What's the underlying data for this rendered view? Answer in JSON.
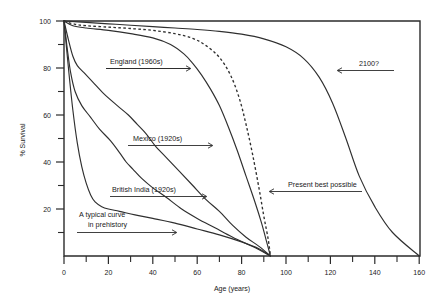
{
  "chart_data": {
    "type": "line",
    "title": "",
    "xlabel": "Age (years)",
    "ylabel": "% Survival",
    "xlim": [
      0,
      160
    ],
    "ylim": [
      0,
      100
    ],
    "grid": false,
    "legend_position": "inline-annotations",
    "x_ticks_major": [
      0,
      20,
      40,
      60,
      80,
      100,
      120,
      140,
      160
    ],
    "x_ticks_minor": [
      10,
      30,
      50,
      70,
      90,
      110,
      130,
      150
    ],
    "y_ticks_major": [
      20,
      40,
      60,
      80,
      100
    ],
    "y_ticks_minor": [
      10,
      30,
      50,
      70,
      90
    ],
    "x_tick_labels": [
      "0",
      "20",
      "40",
      "60",
      "80",
      "100",
      "120",
      "140",
      "160"
    ],
    "y_tick_labels": [
      "20",
      "40",
      "60",
      "80",
      "100"
    ],
    "series": [
      {
        "name": "2100?",
        "style": "solid",
        "annotation": "2100?",
        "points": [
          [
            0,
            100
          ],
          [
            10,
            99.4
          ],
          [
            20,
            98.8
          ],
          [
            30,
            98.2
          ],
          [
            40,
            97.6
          ],
          [
            50,
            97
          ],
          [
            60,
            96.4
          ],
          [
            70,
            95.6
          ],
          [
            80,
            94.4
          ],
          [
            90,
            92.4
          ],
          [
            100,
            89
          ],
          [
            108,
            84
          ],
          [
            115,
            76
          ],
          [
            121,
            65
          ],
          [
            127,
            50
          ],
          [
            133,
            34
          ],
          [
            140,
            21
          ],
          [
            148,
            10
          ],
          [
            160,
            0
          ]
        ]
      },
      {
        "name": "Present best possible",
        "style": "dashed",
        "annotation": "Present best possible",
        "points": [
          [
            0,
            100
          ],
          [
            5,
            98.6
          ],
          [
            10,
            98
          ],
          [
            20,
            97.4
          ],
          [
            30,
            96.8
          ],
          [
            40,
            96
          ],
          [
            50,
            94.6
          ],
          [
            58,
            92.6
          ],
          [
            64,
            89.5
          ],
          [
            70,
            84.5
          ],
          [
            75,
            77
          ],
          [
            79,
            67
          ],
          [
            82,
            56
          ],
          [
            85,
            43
          ],
          [
            88,
            28
          ],
          [
            90,
            17
          ],
          [
            92,
            7
          ],
          [
            93,
            0
          ]
        ]
      },
      {
        "name": "England (1960s)",
        "style": "solid",
        "annotation": "England (1960s)",
        "points": [
          [
            0,
            100
          ],
          [
            4,
            98
          ],
          [
            10,
            97
          ],
          [
            20,
            96
          ],
          [
            30,
            94.6
          ],
          [
            40,
            92.8
          ],
          [
            48,
            90
          ],
          [
            54,
            86
          ],
          [
            58,
            82
          ],
          [
            62,
            77
          ],
          [
            66,
            71
          ],
          [
            70,
            64
          ],
          [
            74,
            55
          ],
          [
            78,
            45
          ],
          [
            82,
            34
          ],
          [
            86,
            23
          ],
          [
            89,
            14
          ],
          [
            91,
            7
          ],
          [
            93,
            0
          ]
        ]
      },
      {
        "name": "Mexico (1920s)",
        "style": "solid",
        "annotation": "Mexico (1920s)",
        "points": [
          [
            0,
            100
          ],
          [
            2,
            92
          ],
          [
            4,
            85
          ],
          [
            6,
            81
          ],
          [
            9,
            78
          ],
          [
            13,
            74
          ],
          [
            18,
            69
          ],
          [
            24,
            64
          ],
          [
            29,
            60
          ],
          [
            33,
            56
          ],
          [
            37,
            52
          ],
          [
            41,
            47
          ],
          [
            46,
            42
          ],
          [
            52,
            36
          ],
          [
            58,
            30
          ],
          [
            64,
            24
          ],
          [
            70,
            19
          ],
          [
            76,
            13
          ],
          [
            82,
            8
          ],
          [
            88,
            4
          ],
          [
            93,
            0
          ]
        ]
      },
      {
        "name": "British India (1920s)",
        "style": "solid",
        "annotation": "British India (1920s)",
        "points": [
          [
            0,
            100
          ],
          [
            1.5,
            88
          ],
          [
            3,
            78
          ],
          [
            5,
            70
          ],
          [
            8,
            64
          ],
          [
            12,
            59
          ],
          [
            16,
            54
          ],
          [
            21,
            49
          ],
          [
            25,
            44
          ],
          [
            28,
            40
          ],
          [
            31,
            37
          ],
          [
            35,
            33
          ],
          [
            40,
            29
          ],
          [
            46,
            25
          ],
          [
            53,
            20
          ],
          [
            60,
            16
          ],
          [
            68,
            12
          ],
          [
            76,
            8
          ],
          [
            85,
            4
          ],
          [
            93,
            0
          ]
        ]
      },
      {
        "name": "A typical curve in prehistory",
        "style": "solid",
        "annotation": "A typical curve in prehistory",
        "points": [
          [
            0,
            100
          ],
          [
            2,
            80
          ],
          [
            4,
            62
          ],
          [
            6,
            48
          ],
          [
            8,
            38
          ],
          [
            10,
            31
          ],
          [
            12,
            26
          ],
          [
            14,
            23
          ],
          [
            17,
            21
          ],
          [
            20,
            20
          ],
          [
            25,
            19
          ],
          [
            32,
            17.5
          ],
          [
            40,
            16
          ],
          [
            50,
            14
          ],
          [
            60,
            11.5
          ],
          [
            70,
            9
          ],
          [
            80,
            6
          ],
          [
            88,
            3
          ],
          [
            93,
            0
          ]
        ]
      }
    ],
    "annotations": [
      {
        "id": "england",
        "text": "England (1960s)",
        "arrow": "right"
      },
      {
        "id": "mexico",
        "text": "Mexico (1920s)",
        "arrow": "right"
      },
      {
        "id": "british-india",
        "text": "British India (1920s)",
        "arrow": "right"
      },
      {
        "id": "prehistory",
        "text": "A typical curve\nin prehistory",
        "line1": "A typical curve",
        "line2": "in prehistory",
        "arrow": "right"
      },
      {
        "id": "present-best",
        "text": "Present best possible",
        "arrow": "left"
      },
      {
        "id": "year-2100",
        "text": "2100?",
        "arrow": "left"
      }
    ],
    "colors": {
      "line": "#2f2f2f",
      "axis": "#2b2b2b",
      "text": "#1a1a1a",
      "background": "#ffffff"
    }
  },
  "labels": {
    "y_axis_title": "% Survival",
    "x_axis_title": "Age (years)",
    "y_100": "100",
    "y_80": "80",
    "y_60": "60",
    "y_40": "40",
    "y_20": "20",
    "x_0": "0",
    "x_20": "20",
    "x_40": "40",
    "x_60": "60",
    "x_80": "80",
    "x_100": "100",
    "x_120": "120",
    "x_140": "140",
    "x_160": "160",
    "annot_england": "England (1960s)",
    "annot_mexico": "Mexico (1920s)",
    "annot_british_india": "British India (1920s)",
    "annot_prehistory_line1": "A typical curve",
    "annot_prehistory_line2": "in prehistory",
    "annot_present_best": "Present best possible",
    "annot_2100": "2100?"
  }
}
